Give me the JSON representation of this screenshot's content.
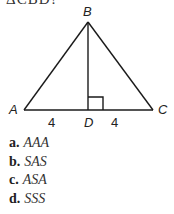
{
  "question": {
    "partial_text": "ΔCBD?"
  },
  "diagram": {
    "vertices": {
      "A": {
        "label": "A",
        "x": 24,
        "y": 110
      },
      "B": {
        "label": "B",
        "x": 88,
        "y": 22
      },
      "C": {
        "label": "C",
        "x": 153,
        "y": 110
      },
      "D": {
        "label": "D",
        "x": 88,
        "y": 110
      }
    },
    "segment_labels": {
      "AD": "4",
      "DC": "4"
    },
    "right_angle_at": "D",
    "line_color": "#1a1a1a"
  },
  "options": [
    {
      "letter": "a.",
      "answer": "AAA"
    },
    {
      "letter": "b.",
      "answer": "SAS"
    },
    {
      "letter": "c.",
      "answer": "ASA"
    },
    {
      "letter": "d.",
      "answer": "SSS"
    }
  ]
}
